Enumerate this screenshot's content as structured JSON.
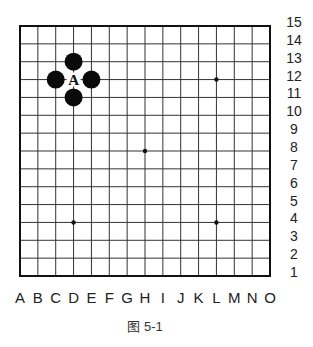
{
  "diagram": {
    "type": "go-board-fragment",
    "grid_size": 15,
    "columns": [
      "A",
      "B",
      "C",
      "D",
      "E",
      "F",
      "G",
      "H",
      "I",
      "J",
      "K",
      "L",
      "M",
      "N",
      "O"
    ],
    "rows": [
      "15",
      "14",
      "13",
      "12",
      "11",
      "10",
      "9",
      "8",
      "7",
      "6",
      "5",
      "4",
      "3",
      "2",
      "1"
    ],
    "star_points": [
      {
        "col": "D",
        "row": 12,
        "x": 3,
        "y": 11
      },
      {
        "col": "L",
        "row": 12,
        "x": 11,
        "y": 3
      },
      {
        "col": "H",
        "row": 8,
        "x": 7,
        "y": 7
      },
      {
        "col": "D",
        "row": 4,
        "x": 3,
        "y": 11
      },
      {
        "col": "L",
        "row": 4,
        "x": 11,
        "y": 11
      }
    ],
    "stones": [
      {
        "color": "black",
        "col": "D",
        "row": 13
      },
      {
        "color": "black",
        "col": "C",
        "row": 12
      },
      {
        "color": "black",
        "col": "E",
        "row": 12
      },
      {
        "color": "black",
        "col": "D",
        "row": 11
      }
    ],
    "markers": [
      {
        "label": "A",
        "col": "D",
        "row": 12
      }
    ],
    "caption": "图 5-1"
  },
  "colors": {
    "line": "#333333",
    "border": "#111111",
    "stone_black": "#0a0a0a",
    "background": "#ffffff"
  }
}
